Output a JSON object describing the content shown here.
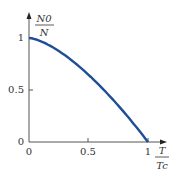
{
  "chart_data": {
    "type": "line",
    "title": "",
    "xlabel": "T/Tc",
    "ylabel": "N0/N",
    "xlabel_num": "T",
    "xlabel_den": "Tc",
    "ylabel_num": "N0",
    "ylabel_den": "N",
    "x_ticks": [
      "0",
      "0.5",
      "1"
    ],
    "y_ticks": [
      "0",
      "0.5",
      "1"
    ],
    "xlim": [
      0,
      1.1
    ],
    "ylim": [
      0,
      1.2
    ],
    "grid": false,
    "series": [
      {
        "name": "N0/N",
        "color": "#1f4e96",
        "x": [
          0,
          0.1,
          0.2,
          0.3,
          0.4,
          0.5,
          0.6,
          0.7,
          0.8,
          0.9,
          1.0
        ],
        "y": [
          1.0,
          0.97,
          0.91,
          0.84,
          0.75,
          0.65,
          0.54,
          0.41,
          0.28,
          0.15,
          0.0
        ]
      }
    ]
  }
}
